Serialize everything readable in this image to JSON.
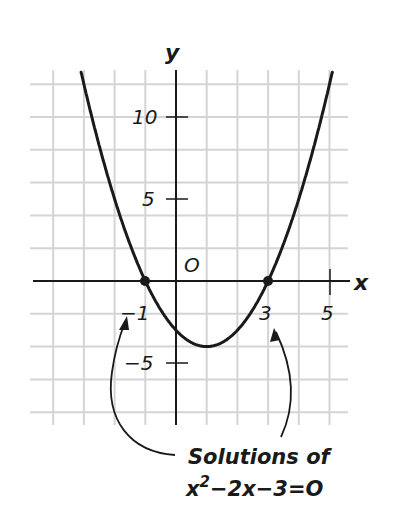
{
  "chart_data": {
    "type": "line",
    "title": "",
    "function": "y = x^2 - 2x - 3",
    "xlabel": "x",
    "ylabel": "y",
    "origin_label": "O",
    "x_range": [
      -4.6,
      5.6
    ],
    "y_range": [
      -9,
      13
    ],
    "grid": true,
    "grid_step_x": 1,
    "grid_step_y": 2,
    "x_ticks": [
      {
        "value": -1,
        "label": "−1"
      },
      {
        "value": 3,
        "label": "3"
      },
      {
        "value": 5,
        "label": "5"
      }
    ],
    "y_ticks": [
      {
        "value": 10,
        "label": "10"
      },
      {
        "value": 5,
        "label": "5"
      },
      {
        "value": -5,
        "label": "−5"
      }
    ],
    "series": [
      {
        "name": "parabola",
        "x": [
          -3,
          -2,
          -1,
          0,
          1,
          2,
          3,
          4,
          5
        ],
        "y": [
          12,
          5,
          0,
          -3,
          -4,
          -3,
          0,
          5,
          12
        ]
      }
    ],
    "vertex": {
      "x": 1,
      "y": -4
    },
    "highlighted_points": [
      {
        "x": -1,
        "y": 0
      },
      {
        "x": 3,
        "y": 0
      }
    ],
    "annotation": {
      "line1": "Solutions of",
      "line2_base": "x",
      "line2_sup": "2",
      "line2_rest": "−2x−3=O",
      "arrows_to": [
        -1,
        3
      ]
    }
  },
  "colors": {
    "grid": "#d4d4d4",
    "ink": "#1a1a1a",
    "background": "#ffffff"
  }
}
